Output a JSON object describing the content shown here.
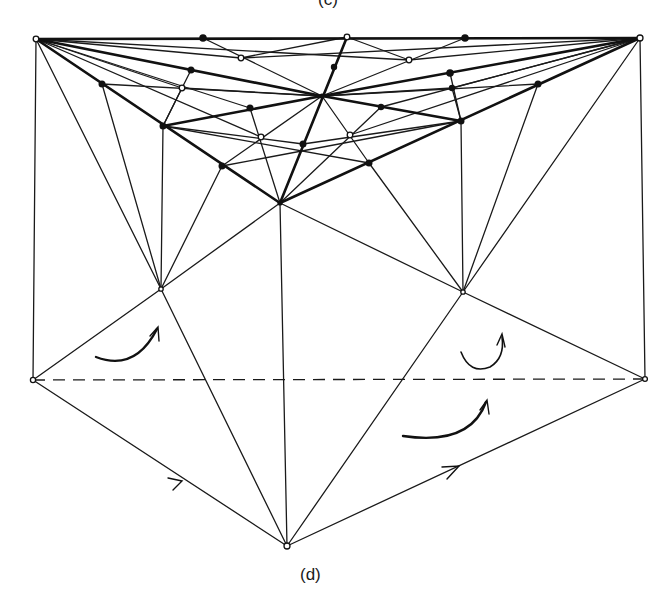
{
  "figure": {
    "top_caption_partial": "(c)",
    "bottom_caption": "(d)",
    "colors": {
      "ink": "#1a1a1a",
      "background": "#ffffff"
    },
    "nodes": {
      "TL": [
        36,
        39
      ],
      "TR": [
        640,
        38
      ],
      "T1": [
        203,
        38
      ],
      "T2": [
        347,
        37
      ],
      "T3": [
        465,
        38
      ],
      "C": [
        322,
        96
      ],
      "A": [
        280,
        203
      ],
      "L": [
        161,
        289
      ],
      "R": [
        463,
        292
      ],
      "LL": [
        33,
        380
      ],
      "RR": [
        645,
        379
      ],
      "B": [
        287,
        546
      ],
      "P1": [
        102,
        84
      ],
      "P2": [
        191,
        70
      ],
      "P3": [
        241,
        58
      ],
      "P4": [
        182,
        88
      ],
      "P5": [
        163,
        126
      ],
      "P6": [
        250,
        108
      ],
      "P7": [
        261,
        137
      ],
      "P8": [
        222,
        166
      ],
      "P9": [
        303,
        144
      ],
      "Q1": [
        334,
        67
      ],
      "Q2": [
        409,
        60
      ],
      "Q3": [
        450,
        73
      ],
      "Q4": [
        452,
        88
      ],
      "Q5": [
        538,
        84
      ],
      "Q6": [
        381,
        107
      ],
      "Q7": [
        350,
        135
      ],
      "Q8": [
        461,
        121
      ],
      "Q9": [
        369,
        163
      ]
    },
    "filled_nodes": [
      "T1",
      "T3",
      "P1",
      "P2",
      "P5",
      "P6",
      "P8",
      "P9",
      "Q1",
      "Q3",
      "Q4",
      "Q5",
      "Q6",
      "Q8",
      "Q9",
      "C",
      "A"
    ],
    "open_nodes": [
      "TL",
      "TR",
      "T2",
      "P3",
      "P4",
      "P7",
      "Q2",
      "Q7",
      "L",
      "R",
      "LL",
      "RR",
      "B"
    ],
    "arrows": [
      "curved-arrow-left-triangle",
      "curved-arrow-right-upper",
      "curved-arrow-right-lower",
      "edge-arrow-left",
      "edge-arrow-right"
    ]
  }
}
